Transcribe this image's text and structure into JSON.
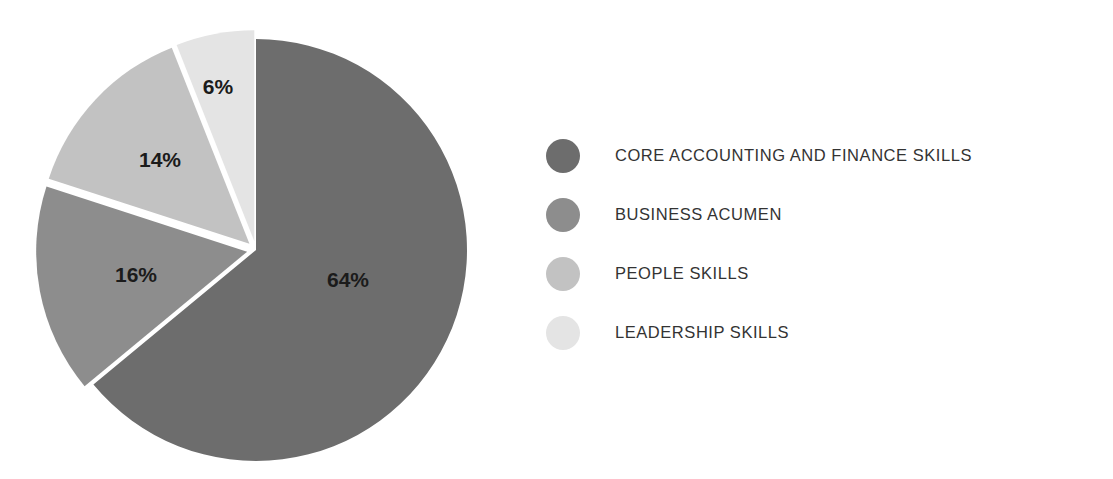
{
  "chart_data": {
    "type": "pie",
    "title": "",
    "subtitle": "",
    "xlabel": "",
    "ylabel": "",
    "grid": false,
    "legend_position": "right",
    "start_angle_deg": 0,
    "direction": "clockwise",
    "categories": [
      "CORE ACCOUNTING AND FINANCE SKILLS",
      "BUSINESS ACUMEN",
      "PEOPLE SKILLS",
      "LEADERSHIP SKILLS"
    ],
    "values": [
      64,
      16,
      14,
      6
    ],
    "unit": "%",
    "data_labels": [
      "64%",
      "16%",
      "14%",
      "6%"
    ],
    "colors": [
      "#6d6d6d",
      "#8d8d8d",
      "#c2c2c2",
      "#e4e4e4"
    ],
    "exploded": [
      false,
      true,
      true,
      true
    ],
    "slices": [
      {
        "label": "CORE ACCOUNTING AND FINANCE SKILLS",
        "value": 64,
        "data_label": "64%",
        "color": "#6d6d6d"
      },
      {
        "label": "BUSINESS ACUMEN",
        "value": 16,
        "data_label": "16%",
        "color": "#8d8d8d"
      },
      {
        "label": "PEOPLE SKILLS",
        "value": 14,
        "data_label": "14%",
        "color": "#c2c2c2"
      },
      {
        "label": "LEADERSHIP SKILLS",
        "value": 6,
        "data_label": "6%",
        "color": "#e4e4e4"
      }
    ]
  },
  "pie": {
    "labels": {
      "core": "64%",
      "business": "16%",
      "people": "14%",
      "leadership": "6%"
    }
  },
  "legend": {
    "items": [
      {
        "label": "CORE ACCOUNTING AND FINANCE SKILLS",
        "color": "#6d6d6d"
      },
      {
        "label": "BUSINESS ACUMEN",
        "color": "#8d8d8d"
      },
      {
        "label": "PEOPLE SKILLS",
        "color": "#c2c2c2"
      },
      {
        "label": "LEADERSHIP SKILLS",
        "color": "#e4e4e4"
      }
    ]
  },
  "colors": {
    "slice_core": "#6d6d6d",
    "slice_business": "#8d8d8d",
    "slice_people": "#c2c2c2",
    "slice_leadership": "#e4e4e4",
    "background": "#ffffff",
    "label_text": "#1b1b1b",
    "legend_text": "#333333"
  }
}
